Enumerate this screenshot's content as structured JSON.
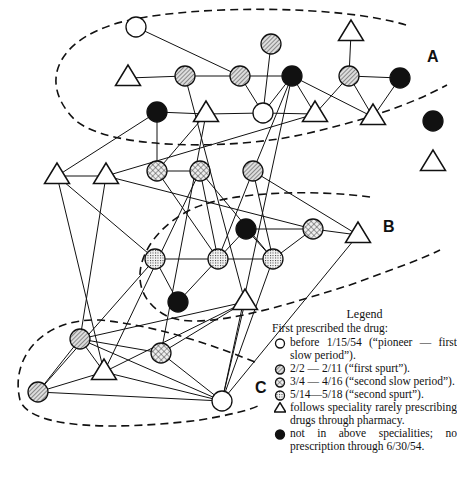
{
  "diagram": {
    "cluster_labels": {
      "A": "A",
      "B": "B",
      "C": "C"
    },
    "nodes": [
      {
        "id": "a1",
        "type": "open",
        "x": 136,
        "y": 27
      },
      {
        "id": "a2",
        "type": "hatched",
        "x": 271,
        "y": 44
      },
      {
        "id": "a3",
        "type": "triangle",
        "x": 351,
        "y": 33
      },
      {
        "id": "a4",
        "type": "triangle",
        "x": 128,
        "y": 78
      },
      {
        "id": "a5",
        "type": "hatched",
        "x": 185,
        "y": 76
      },
      {
        "id": "a6",
        "type": "hatched",
        "x": 240,
        "y": 76
      },
      {
        "id": "a7",
        "type": "black",
        "x": 292,
        "y": 76
      },
      {
        "id": "a8",
        "type": "hatched",
        "x": 349,
        "y": 76
      },
      {
        "id": "a9",
        "type": "black",
        "x": 400,
        "y": 78
      },
      {
        "id": "a10",
        "type": "black",
        "x": 157,
        "y": 112
      },
      {
        "id": "a11",
        "type": "triangle",
        "x": 206,
        "y": 114
      },
      {
        "id": "a12",
        "type": "open",
        "x": 263,
        "y": 113
      },
      {
        "id": "a13",
        "type": "triangle",
        "x": 315,
        "y": 114
      },
      {
        "id": "a14",
        "type": "triangle",
        "x": 373,
        "y": 117
      },
      {
        "id": "x1",
        "type": "black",
        "x": 433,
        "y": 121
      },
      {
        "id": "x2",
        "type": "triangle",
        "x": 433,
        "y": 163
      },
      {
        "id": "b1",
        "type": "triangle",
        "x": 57,
        "y": 176
      },
      {
        "id": "b2",
        "type": "triangle",
        "x": 106,
        "y": 176
      },
      {
        "id": "b3",
        "type": "crosshatch",
        "x": 157,
        "y": 171
      },
      {
        "id": "b4",
        "type": "crosshatch",
        "x": 200,
        "y": 171
      },
      {
        "id": "b5",
        "type": "hatched",
        "x": 253,
        "y": 171
      },
      {
        "id": "b6",
        "type": "black",
        "x": 246,
        "y": 229
      },
      {
        "id": "b7",
        "type": "crosshatch",
        "x": 313,
        "y": 229
      },
      {
        "id": "b8",
        "type": "triangle",
        "x": 358,
        "y": 235
      },
      {
        "id": "b9",
        "type": "dotted",
        "x": 155,
        "y": 259
      },
      {
        "id": "b10",
        "type": "dotted",
        "x": 218,
        "y": 259
      },
      {
        "id": "b11",
        "type": "dotted",
        "x": 273,
        "y": 259
      },
      {
        "id": "b12",
        "type": "black",
        "x": 178,
        "y": 302
      },
      {
        "id": "b13",
        "type": "triangle",
        "x": 245,
        "y": 302
      },
      {
        "id": "c1",
        "type": "hatched",
        "x": 80,
        "y": 339
      },
      {
        "id": "c2",
        "type": "crosshatch",
        "x": 161,
        "y": 353
      },
      {
        "id": "c3",
        "type": "triangle",
        "x": 104,
        "y": 372
      },
      {
        "id": "c4",
        "type": "hatched",
        "x": 38,
        "y": 392
      },
      {
        "id": "c5",
        "type": "open",
        "x": 222,
        "y": 401
      }
    ],
    "edges": [
      [
        "a1",
        "a6"
      ],
      [
        "a4",
        "a5"
      ],
      [
        "a5",
        "a6"
      ],
      [
        "a6",
        "a7"
      ],
      [
        "a2",
        "a12"
      ],
      [
        "a6",
        "a12"
      ],
      [
        "a7",
        "a12"
      ],
      [
        "a7",
        "a14"
      ],
      [
        "a7",
        "a13"
      ],
      [
        "a8",
        "a3"
      ],
      [
        "a8",
        "a9"
      ],
      [
        "a8",
        "a13"
      ],
      [
        "a8",
        "a14"
      ],
      [
        "a9",
        "a14"
      ],
      [
        "a10",
        "a11"
      ],
      [
        "a11",
        "a12"
      ],
      [
        "a12",
        "a13"
      ],
      [
        "a5",
        "b13"
      ],
      [
        "a7",
        "b5"
      ],
      [
        "a7",
        "c5"
      ],
      [
        "a10",
        "b1"
      ],
      [
        "a10",
        "b3"
      ],
      [
        "a11",
        "b3"
      ],
      [
        "a11",
        "c2"
      ],
      [
        "b1",
        "b2"
      ],
      [
        "b2",
        "a13"
      ],
      [
        "b3",
        "b4"
      ],
      [
        "b4",
        "b10"
      ],
      [
        "b3",
        "b10"
      ],
      [
        "b4",
        "b11"
      ],
      [
        "b5",
        "b10"
      ],
      [
        "b5",
        "b11"
      ],
      [
        "b5",
        "b8"
      ],
      [
        "b6",
        "b7"
      ],
      [
        "b6",
        "b10"
      ],
      [
        "b6",
        "b11"
      ],
      [
        "b7",
        "b8"
      ],
      [
        "b7",
        "b11"
      ],
      [
        "b9",
        "b10"
      ],
      [
        "b10",
        "b11"
      ],
      [
        "b9",
        "b12"
      ],
      [
        "b10",
        "b12"
      ],
      [
        "b9",
        "c4"
      ],
      [
        "b1",
        "b9"
      ],
      [
        "b2",
        "b7"
      ],
      [
        "b2",
        "c1"
      ],
      [
        "b11",
        "c5"
      ],
      [
        "b13",
        "c5"
      ],
      [
        "b8",
        "c5"
      ],
      [
        "b13",
        "c1"
      ],
      [
        "b4",
        "c3"
      ],
      [
        "c1",
        "c2"
      ],
      [
        "c1",
        "c5"
      ],
      [
        "c1",
        "c3"
      ],
      [
        "c1",
        "c4"
      ],
      [
        "c2",
        "c5"
      ],
      [
        "c3",
        "c5"
      ],
      [
        "c4",
        "c5"
      ],
      [
        "c4",
        "c3"
      ],
      [
        "c3",
        "b13"
      ],
      [
        "c2",
        "b13"
      ],
      [
        "b1",
        "c3"
      ]
    ]
  },
  "legend": {
    "title": "Legend",
    "heading": "First prescribed the drug:",
    "items": [
      {
        "symbol": "open",
        "text": "before 1/15/54 (“pioneer — first slow period”)."
      },
      {
        "symbol": "hatched",
        "text": "2/2 — 2/11 (“first spurt”)."
      },
      {
        "symbol": "crosshatch",
        "text": "3/4 — 4/16 (“second slow period”)."
      },
      {
        "symbol": "dotted",
        "text": "5/14—5/18 (“second spurt”)."
      },
      {
        "symbol": "triangle",
        "text": "follows speciality rarely prescribing drugs through pharmacy."
      },
      {
        "symbol": "black",
        "text": "not in above specialities; no prescription through 6/30/54."
      }
    ]
  }
}
